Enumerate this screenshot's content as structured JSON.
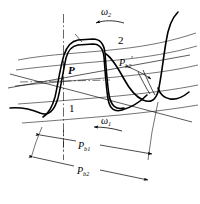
{
  "figure": {
    "type": "engineering-diagram",
    "background_color": "#ffffff",
    "line_color": "#000000",
    "width": 200,
    "height": 204
  },
  "labels": {
    "omega_2": "ω",
    "omega_2_sub": "2",
    "omega_1": "ω",
    "omega_1_sub": "1",
    "gear_two": "2",
    "gear_one": "1",
    "pitch_point": "P",
    "base_pitch_2_prime": "P",
    "base_pitch_2_prime_sub": "b2",
    "base_pitch_2_prime_mark": "′",
    "base_pitch_1": "P",
    "base_pitch_1_sub": "b1",
    "base_pitch_2": "P",
    "base_pitch_2_sub": "b2"
  },
  "annotations": {
    "omega_2_arrow_direction": "left",
    "omega_1_arrow_direction": "left",
    "pb2_prime_arrow_direction": "down-right",
    "pb1_dimension": "double-headed",
    "pb2_dimension": "double-headed",
    "centerline_style": "dash-dot"
  }
}
